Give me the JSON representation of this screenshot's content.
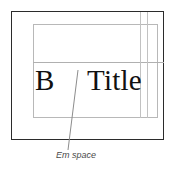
{
  "figure": {
    "name": "em-space-typography-diagram",
    "caption": "Em space",
    "sample": {
      "left_glyph": "B",
      "right_word": "Title"
    },
    "colors": {
      "outer_frame": "#2b2b2b",
      "inner_frame": "#b8b8b8",
      "guide_rule": "#b0b0b0",
      "vertical_guide": "#c2c2c2",
      "text": "#111111",
      "caption_text": "#4a4a4a",
      "background": "#ffffff"
    }
  }
}
